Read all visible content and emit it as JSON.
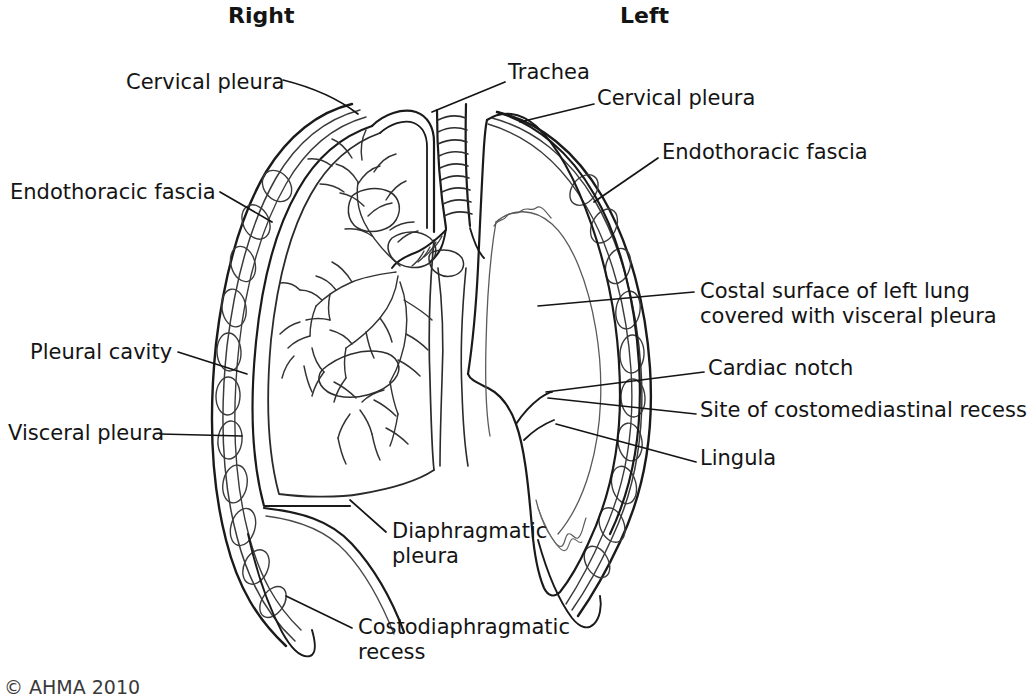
{
  "figure": {
    "title_left": "Right",
    "title_right": "Left",
    "copyright": "© AHMA 2010",
    "ink_color": "#1a1a1a",
    "thin_ink_color": "#555555",
    "background": "#ffffff"
  },
  "labels": {
    "cervical_pleura_right": "Cervical pleura",
    "endothoracic_fascia_right": "Endothoracic fascia",
    "pleural_cavity": "Pleural cavity",
    "visceral_pleura": "Visceral pleura",
    "diaphragmatic_pleura_line1": "Diaphragmatic",
    "diaphragmatic_pleura_line2": "pleura",
    "costodiaphragmatic_line1": "Costodiaphragmatic",
    "costodiaphragmatic_line2": "recess",
    "trachea": "Trachea",
    "cervical_pleura_left": "Cervical pleura",
    "endothoracic_fascia_left": "Endothoracic fascia",
    "costal_surface_line1": "Costal surface of left lung",
    "costal_surface_line2": "covered with visceral pleura",
    "cardiac_notch": "Cardiac notch",
    "costomediastinal_recess": "Site of costomediastinal recess",
    "lingula": "Lingula"
  },
  "diagram_data": {
    "type": "anatomical-line-drawing",
    "subject": "Thoracic cavity, pleurae and lungs (coronal section)",
    "sides": [
      "Right",
      "Left"
    ],
    "annotations": [
      {
        "name": "Cervical pleura",
        "side": "right",
        "text_xy": [
          128,
          85
        ],
        "target_xy": [
          355,
          113
        ]
      },
      {
        "name": "Endothoracic fascia",
        "side": "right",
        "text_xy": [
          12,
          195
        ],
        "target_xy": [
          272,
          220
        ]
      },
      {
        "name": "Pleural cavity",
        "side": "right",
        "text_xy": [
          32,
          355
        ],
        "target_xy": [
          245,
          372
        ]
      },
      {
        "name": "Visceral pleura",
        "side": "right",
        "text_xy": [
          8,
          436
        ],
        "target_xy": [
          241,
          436
        ]
      },
      {
        "name": "Diaphragmatic pleura",
        "side": "right",
        "text_xy": [
          392,
          534
        ],
        "target_xy": [
          350,
          500
        ]
      },
      {
        "name": "Costodiaphragmatic recess",
        "side": "right",
        "text_xy": [
          358,
          630
        ],
        "target_xy": [
          286,
          596
        ]
      },
      {
        "name": "Trachea",
        "side": "center",
        "text_xy": [
          508,
          75
        ],
        "target_xy": [
          432,
          110
        ]
      },
      {
        "name": "Cervical pleura",
        "side": "left",
        "text_xy": [
          597,
          101
        ],
        "target_xy": [
          520,
          122
        ]
      },
      {
        "name": "Endothoracic fascia",
        "side": "left",
        "text_xy": [
          662,
          155
        ],
        "target_xy": [
          595,
          200
        ]
      },
      {
        "name": "Costal surface of left lung covered with visceral pleura",
        "side": "left",
        "text_xy": [
          700,
          290
        ],
        "target_xy": [
          540,
          305
        ]
      },
      {
        "name": "Cardiac notch",
        "side": "left",
        "text_xy": [
          708,
          370
        ],
        "target_xy": [
          546,
          392
        ]
      },
      {
        "name": "Site of costomediastinal recess",
        "side": "left",
        "text_xy": [
          700,
          412
        ],
        "target_xy": [
          548,
          398
        ]
      },
      {
        "name": "Lingula",
        "side": "left",
        "text_xy": [
          700,
          460
        ],
        "target_xy": [
          557,
          425
        ]
      }
    ],
    "structures": [
      "chest wall with ribs (right and left)",
      "parietal pleura",
      "visceral pleura",
      "pleural cavity",
      "right lung with bronchial tree and pulmonary vessels",
      "left lung intact with cardiac notch and lingula",
      "trachea with cartilage rings",
      "carina and main bronchi",
      "diaphragm",
      "costodiaphragmatic recess"
    ]
  }
}
